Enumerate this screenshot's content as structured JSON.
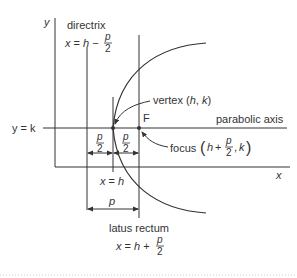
{
  "diagram": {
    "type": "parabola-geometry",
    "axes": {
      "x_label": "x",
      "y_label": "y"
    },
    "labels": {
      "directrix": "directrix",
      "directrix_eq_lhs": "x = h −",
      "parabolic_axis": "parabolic axis",
      "y_eq_k": "y = k",
      "vertex": "vertex (h, k)",
      "vertex_pre": "vertex (",
      "vertex_h": "h",
      "vertex_comma": ", ",
      "vertex_k": "k",
      "vertex_post": ")",
      "focus_word": "focus",
      "focus_point": "F",
      "focus_h_plus": "h +",
      "focus_k": ", k",
      "x_eq_h": "x = h",
      "p": "p",
      "p_half_num": "p",
      "p_half_den": "2",
      "latus_rectum": "latus rectum",
      "latus_eq_lhs": "x = h +"
    },
    "colors": {
      "line": "#333333",
      "background": "#ffffff",
      "dotted_rule": "#cccccc"
    }
  }
}
